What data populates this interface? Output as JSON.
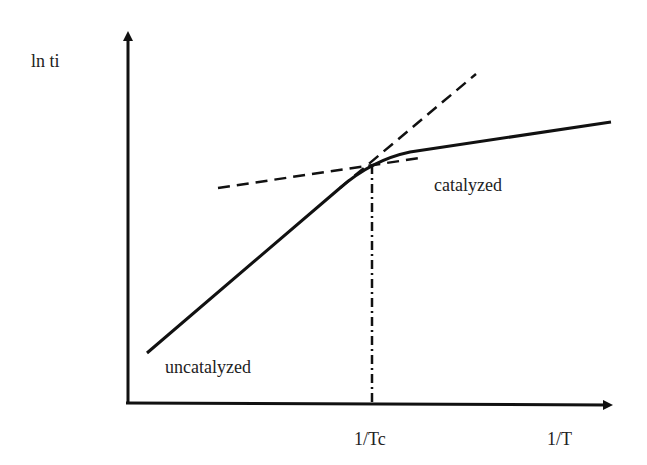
{
  "diagram": {
    "y_axis_label": "ln ti",
    "x_axis_label": "1/T",
    "x_tick_label": "1/Tc",
    "curve_labels": {
      "uncatalyzed": "uncatalyzed",
      "catalyzed": "catalyzed"
    },
    "colors": {
      "line": "#111111",
      "background": "#ffffff"
    }
  }
}
